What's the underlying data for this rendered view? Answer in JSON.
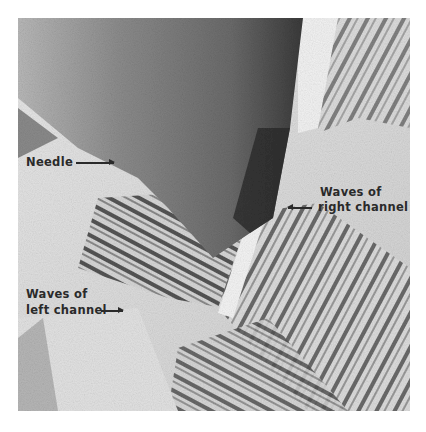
{
  "figure": {
    "type": "micrograph",
    "labels": {
      "needle": "Needle",
      "right_channel_line1": "Waves of",
      "right_channel_line2": "right channel",
      "left_channel_line1": "Waves of",
      "left_channel_line2": "left channel"
    }
  }
}
